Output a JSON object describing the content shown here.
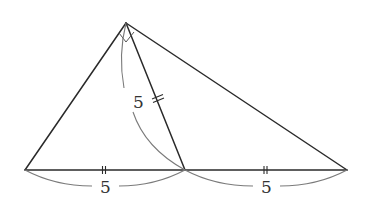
{
  "figure": {
    "vertices": {
      "A": [
        126,
        23
      ],
      "B": [
        25,
        170
      ],
      "M": [
        185,
        170
      ],
      "D": [
        347,
        170
      ]
    },
    "labels": {
      "median_length": "5",
      "left_base_length": "5",
      "right_base_length": "5"
    },
    "marks": {
      "right_angle_at": "A",
      "equal_ticks": [
        "BM",
        "MD",
        "AM"
      ],
      "tick_style": "double"
    },
    "colors": {
      "line": "#2a2a2a",
      "arc": "#7a7a7a",
      "background": "#ffffff"
    }
  }
}
